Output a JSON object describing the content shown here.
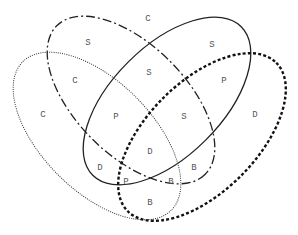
{
  "diagram": {
    "type": "venn-4-ellipses",
    "sets": [
      {
        "id": "dotted",
        "style": "thin dotted",
        "cx": 97,
        "cy": 136,
        "rx": 105,
        "ry": 55,
        "rotate": 45
      },
      {
        "id": "dashdot",
        "style": "long dash",
        "cx": 131,
        "cy": 100,
        "rx": 105,
        "ry": 55,
        "rotate": 45
      },
      {
        "id": "solid",
        "style": "solid",
        "cx": 167,
        "cy": 101,
        "rx": 105,
        "ry": 55,
        "rotate": -45
      },
      {
        "id": "thickdot",
        "style": "thick dotted",
        "cx": 202,
        "cy": 137,
        "rx": 105,
        "ry": 55,
        "rotate": -45
      }
    ],
    "labels": [
      {
        "text": "C",
        "x": 148,
        "y": 21
      },
      {
        "text": "S",
        "x": 88,
        "y": 45
      },
      {
        "text": "S",
        "x": 212,
        "y": 47
      },
      {
        "text": "C",
        "x": 75,
        "y": 83
      },
      {
        "text": "S",
        "x": 149,
        "y": 75
      },
      {
        "text": "P",
        "x": 224,
        "y": 83
      },
      {
        "text": "C",
        "x": 43,
        "y": 117
      },
      {
        "text": "P",
        "x": 116,
        "y": 119
      },
      {
        "text": "S",
        "x": 184,
        "y": 119
      },
      {
        "text": "D",
        "x": 255,
        "y": 117
      },
      {
        "text": "D",
        "x": 150,
        "y": 154
      },
      {
        "text": "D",
        "x": 100,
        "y": 170
      },
      {
        "text": "B",
        "x": 194,
        "y": 170
      },
      {
        "text": "P",
        "x": 126,
        "y": 184
      },
      {
        "text": "B",
        "x": 171,
        "y": 184
      },
      {
        "text": "B",
        "x": 150,
        "y": 205
      }
    ]
  }
}
